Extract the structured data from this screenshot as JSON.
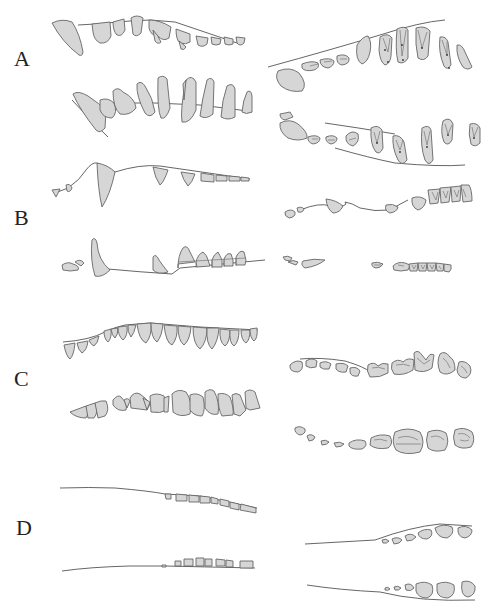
{
  "figure": {
    "panels": [
      {
        "label": "A",
        "views": [
          "upper lateral",
          "lower lateral",
          "upper occlusal",
          "lower occlusal"
        ]
      },
      {
        "label": "B",
        "views": [
          "upper lateral",
          "lower lateral",
          "upper occlusal",
          "lower occlusal"
        ]
      },
      {
        "label": "C",
        "views": [
          "upper lateral",
          "lower lateral",
          "upper occlusal",
          "lower occlusal"
        ]
      },
      {
        "label": "D",
        "views": [
          "upper lateral",
          "lower lateral",
          "upper occlusal",
          "lower occlusal"
        ]
      }
    ],
    "colors": {
      "tooth_fill": "#d6d6d6",
      "outline": "#666666",
      "background": "#ffffff"
    }
  }
}
